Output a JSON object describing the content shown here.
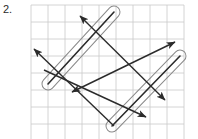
{
  "problem": {
    "number_label": "2.",
    "kind": "geometry-grid-figure",
    "description": "Grid with two highlighted parallel segments circled by capsule outlines and four double-headed arrow lines"
  },
  "canvas": {
    "width": 198,
    "height": 139,
    "background_color": "#ffffff"
  },
  "grid": {
    "x": 31,
    "y": 5,
    "width": 159,
    "height": 130,
    "cell_size": 17.0,
    "columns": 9,
    "rows": 8,
    "line_color": "#c9c9c9",
    "line_width": 0.8,
    "show": true
  },
  "chart_data": {
    "type": "diagram",
    "title": "",
    "xlabel": "",
    "ylabel": "",
    "grid": true,
    "highlighted_segments": [
      {
        "name": "segment-upper-left",
        "x1": 48,
        "y1": 84,
        "x2": 114,
        "y2": 12,
        "stroke": "#2b2b2b",
        "capsule_stroke": "#8a8a8a",
        "capsule_half_width": 6
      },
      {
        "name": "segment-lower-right",
        "x1": 112,
        "y1": 126,
        "x2": 180,
        "y2": 56,
        "stroke": "#2b2b2b",
        "capsule_stroke": "#8a8a8a",
        "capsule_half_width": 6
      }
    ],
    "arrow_lines": [
      {
        "name": "arrow-line-1",
        "x1": 34,
        "y1": 49,
        "x2": 114,
        "y2": 126,
        "arrow_start": true,
        "arrow_end": false,
        "stroke": "#2b2b2b"
      },
      {
        "name": "arrow-line-2",
        "x1": 80,
        "y1": 16,
        "x2": 165,
        "y2": 100,
        "arrow_start": true,
        "arrow_end": true,
        "stroke": "#2b2b2b"
      },
      {
        "name": "arrow-line-3",
        "x1": 72,
        "y1": 92,
        "x2": 175,
        "y2": 42,
        "arrow_start": true,
        "arrow_end": true,
        "stroke": "#2b2b2b"
      },
      {
        "name": "arrow-line-4",
        "x1": 44,
        "y1": 70,
        "x2": 146,
        "y2": 117,
        "arrow_start": false,
        "arrow_end": true,
        "stroke": "#2b2b2b"
      }
    ],
    "colors": {
      "stroke": "#2b2b2b",
      "grid": "#c9c9c9",
      "capsule": "#8a8a8a",
      "text": "#2a2a2a"
    }
  }
}
